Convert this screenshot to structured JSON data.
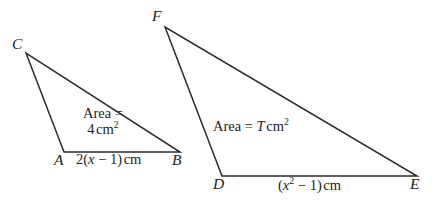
{
  "figure": {
    "caption": "Two triangles with area annotations",
    "background_color": "#ffffff",
    "stroke_color": "#2a2a30",
    "text_color": "#1d1d22",
    "width": 435,
    "height": 214
  },
  "left_triangle": {
    "name": "triangle-ABC",
    "vertices": {
      "C": {
        "label": "C",
        "x": 26,
        "y": 53
      },
      "A": {
        "label": "A",
        "x": 64,
        "y": 152
      },
      "B": {
        "label": "B",
        "x": 180,
        "y": 152
      }
    },
    "area_label": {
      "line1": "Area =",
      "line2_value": "4",
      "line2_unit": "cm",
      "line2_exponent": "2"
    },
    "base_label": {
      "prefix": "2(",
      "variable": "x",
      "operator": " − 1)",
      "unit": "cm"
    }
  },
  "right_triangle": {
    "name": "triangle-DEF",
    "vertices": {
      "F": {
        "label": "F",
        "x": 165,
        "y": 27
      },
      "D": {
        "label": "D",
        "x": 222,
        "y": 176
      },
      "E": {
        "label": "E",
        "x": 417,
        "y": 176
      }
    },
    "area_label": {
      "prefix": "Area = ",
      "variable": "T",
      "unit": "cm",
      "exponent": "2"
    },
    "base_label": {
      "open": "(",
      "variable": "x",
      "exponent": "2",
      "operator": " − 1)",
      "unit": "cm"
    }
  }
}
